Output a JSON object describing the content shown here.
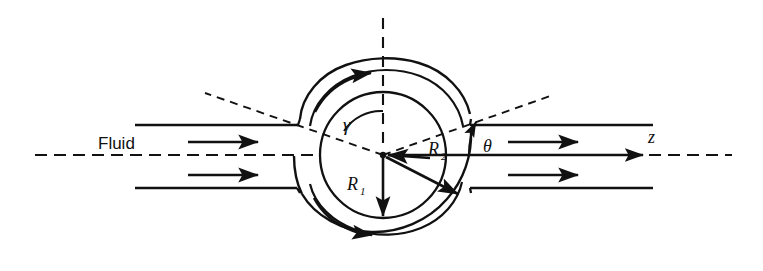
{
  "figure": {
    "kind": "schematic-diagram",
    "background_color": "#ffffff",
    "line_color": "#111111",
    "width": 763,
    "height": 271
  },
  "labels": {
    "fluid": "Fluid",
    "axis_z": "z",
    "angle_gamma": "γ",
    "angle_theta": "θ",
    "radius_inner": "R",
    "radius_inner_sub": "1",
    "radius_outer": "R",
    "radius_outer_sub": "2"
  },
  "geometry": {
    "center": {
      "x": 383,
      "y": 155
    },
    "inner_radius": 63,
    "outer_radius": 88,
    "pipe_upper_wall_y": 125,
    "pipe_lower_wall_y": 188,
    "centerline_y": 155,
    "pipe_left_start_x": 135,
    "pipe_right_end_x": 655,
    "centerline_left_x": 35,
    "centerline_right_x": 732,
    "z_arrow_tip_x": 645
  },
  "annotations": {
    "flow_arrows": [
      {
        "name": "upper-left-flow-arrow",
        "x1": 188,
        "y1": 142,
        "x2": 262,
        "y2": 142
      },
      {
        "name": "lower-left-flow-arrow",
        "x1": 188,
        "y1": 175,
        "x2": 262,
        "y2": 175
      },
      {
        "name": "upper-right-flow-arrow",
        "x1": 508,
        "y1": 142,
        "x2": 582,
        "y2": 142
      },
      {
        "name": "lower-right-flow-arrow",
        "x1": 508,
        "y1": 175,
        "x2": 582,
        "y2": 175
      },
      {
        "name": "fluid-label-arrow",
        "x1": 186,
        "y1": 142,
        "x2": 262,
        "y2": 142
      }
    ],
    "radius_vectors": [
      {
        "name": "R1-vector",
        "from": "center",
        "to": {
          "x": 383,
          "y": 218
        },
        "label": "R1"
      },
      {
        "name": "R2-vector",
        "from": "center",
        "to": {
          "x": 460,
          "y": 196
        },
        "label": "R2"
      }
    ],
    "circulation_arrows": [
      {
        "name": "top-circulation-arrow",
        "position": "upper-left-outer-arc"
      },
      {
        "name": "bottom-circulation-arrow",
        "position": "lower-left-outer-arc"
      }
    ]
  }
}
